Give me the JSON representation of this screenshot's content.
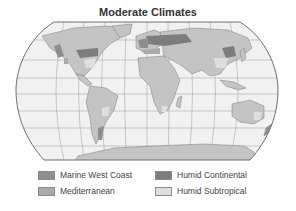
{
  "title": "Moderate Climates",
  "colors": {
    "ocean": "#f1f1f1",
    "land": "#c4c4c4",
    "border": "#6e6e6e",
    "graticule": "#9a9a9a",
    "marine_west_coast": "#8e8e8e",
    "mediterranean": "#a9a9a9",
    "humid_continental": "#7d7d7d",
    "humid_subtropical": "#dedede"
  },
  "legend": [
    {
      "label": "Marine West Coast",
      "color": "#8e8e8e"
    },
    {
      "label": "Mediterranean",
      "color": "#a9a9a9"
    },
    {
      "label": "Humid Continental",
      "color": "#7d7d7d"
    },
    {
      "label": "Humid Subtropical",
      "color": "#dedede"
    }
  ]
}
